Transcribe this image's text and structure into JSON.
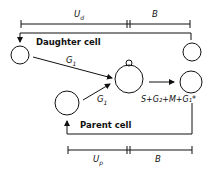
{
  "diagram": {
    "labels": {
      "ud": "U",
      "ud_sub": "d",
      "b_top": "B",
      "daughter": "Daughter cell",
      "g1_top": "G",
      "g1_top_sub": "1",
      "g1_bottom": "G",
      "g1_bottom_sub": "1",
      "phase": "S+G₂+M+G₁*",
      "parent": "Parent cell",
      "up": "U",
      "up_sub": "p",
      "b_bottom": "B"
    },
    "colors": {
      "stroke": "#111111",
      "background": "#ffffff"
    }
  }
}
